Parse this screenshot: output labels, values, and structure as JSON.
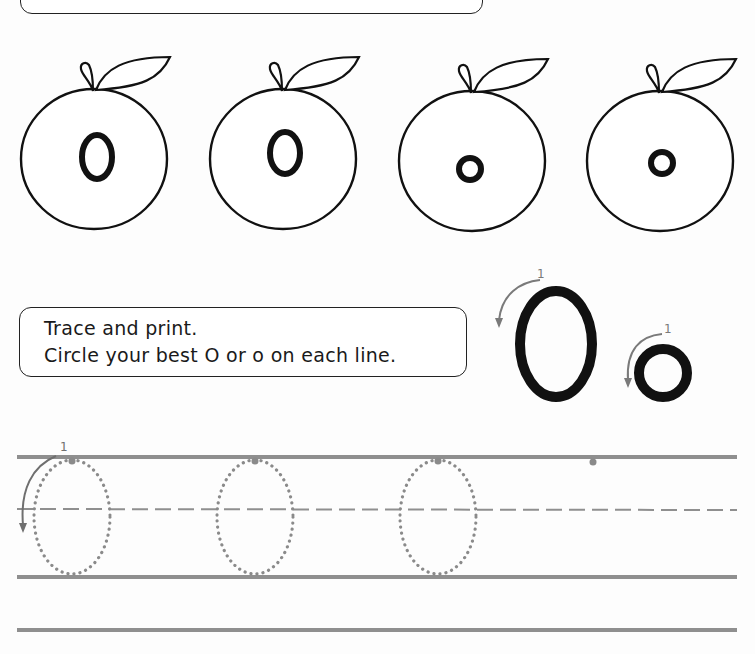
{
  "worksheet": {
    "letter_upper": "O",
    "letter_lower": "o",
    "apples": [
      {
        "letter": "O",
        "case": "upper"
      },
      {
        "letter": "O",
        "case": "upper"
      },
      {
        "letter": "o",
        "case": "lower"
      },
      {
        "letter": "o",
        "case": "lower"
      }
    ],
    "instructions": {
      "line1": "Trace and print.",
      "line2": "Circle your best O or o on each line."
    },
    "stroke_guide": {
      "upper_step": "1",
      "lower_step": "1",
      "direction": "counter-clockwise"
    },
    "trace_row": {
      "step_label": "1",
      "traced_letters": 3,
      "start_dots": 4
    },
    "colors": {
      "ink": "#111111",
      "guide_line": "#8f8f8f",
      "dotted_trace": "#8a8a8a",
      "arrow": "#7a7a7a"
    }
  }
}
